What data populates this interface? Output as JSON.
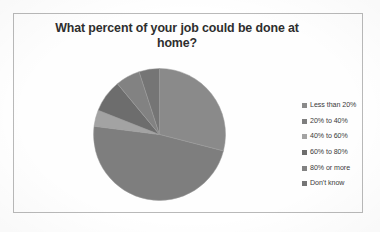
{
  "chart_data": {
    "type": "pie",
    "title": "What percent of your job could be done at home?",
    "title_line1": "What percent of your job could be done at",
    "title_line2": "home?",
    "categories": [
      "Less than 20%",
      "20% to 40%",
      "40% to 60%",
      "60% to 80%",
      "80% or more",
      "Don't know"
    ],
    "values": [
      29,
      48,
      4,
      8,
      6,
      5
    ],
    "slice_colors": [
      "#8a8a8a",
      "#7e7e7e",
      "#a3a3a3",
      "#6d6d6d",
      "#828282",
      "#757575"
    ],
    "legend_position": "right",
    "grid": false,
    "xlabel": "",
    "ylabel": "",
    "start_angle_deg": 0,
    "direction": "clockwise"
  },
  "legend": {
    "items": [
      {
        "label": "Less than 20%",
        "color": "#8a8a8a"
      },
      {
        "label": "20% to 40%",
        "color": "#7e7e7e"
      },
      {
        "label": "40% to 60%",
        "color": "#a3a3a3"
      },
      {
        "label": "60% to 80%",
        "color": "#6d6d6d"
      },
      {
        "label": "80% or more",
        "color": "#828282"
      },
      {
        "label": "Don't know",
        "color": "#757575"
      }
    ]
  },
  "frame": {
    "border_color": "#b9b9b9",
    "background": "#fefefe"
  }
}
